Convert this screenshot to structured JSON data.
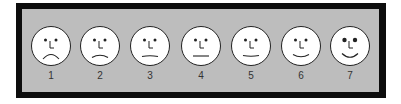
{
  "scale": {
    "colors": {
      "frame": "#0d0d0d",
      "panel": "#bdbdbd",
      "face": "#ffffff",
      "stroke": "#222222"
    },
    "faces": [
      {
        "label": "1",
        "expression": "very-sad",
        "mouth_curve": -6
      },
      {
        "label": "2",
        "expression": "sad",
        "mouth_curve": -3
      },
      {
        "label": "3",
        "expression": "slightly-sad",
        "mouth_curve": -1
      },
      {
        "label": "4",
        "expression": "neutral",
        "mouth_curve": 0
      },
      {
        "label": "5",
        "expression": "slightly-happy",
        "mouth_curve": 1
      },
      {
        "label": "6",
        "expression": "happy",
        "mouth_curve": 3
      },
      {
        "label": "7",
        "expression": "very-happy",
        "mouth_curve": 5
      }
    ]
  }
}
